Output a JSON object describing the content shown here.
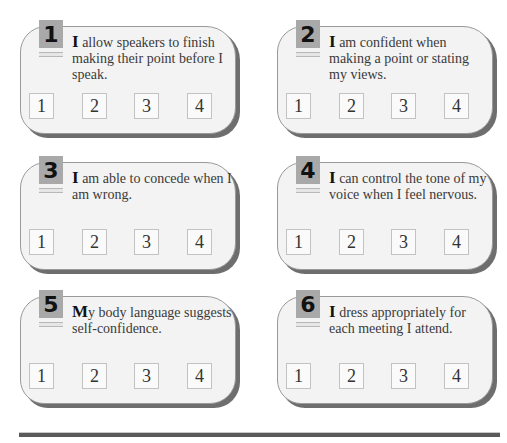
{
  "items": [
    {
      "number": "1",
      "lead": "I",
      "text": " allow speakers to finish making their point before I speak."
    },
    {
      "number": "2",
      "lead": "I",
      "text": " am confident when making a point or stating my views."
    },
    {
      "number": "3",
      "lead": "I",
      "text": " am able to concede when I am wrong."
    },
    {
      "number": "4",
      "lead": "I",
      "text": " can control the tone of my voice when I feel nervous."
    },
    {
      "number": "5",
      "lead": "M",
      "text": "y body language suggests self-confidence."
    },
    {
      "number": "6",
      "lead": "I",
      "text": " dress appropriately for each meeting I attend."
    }
  ],
  "scale": [
    "1",
    "2",
    "3",
    "4"
  ],
  "colors": {
    "card_bg": "#f3f3f3",
    "tab_bg": "#a9a9a9",
    "shadow": "#6e6e6e"
  }
}
